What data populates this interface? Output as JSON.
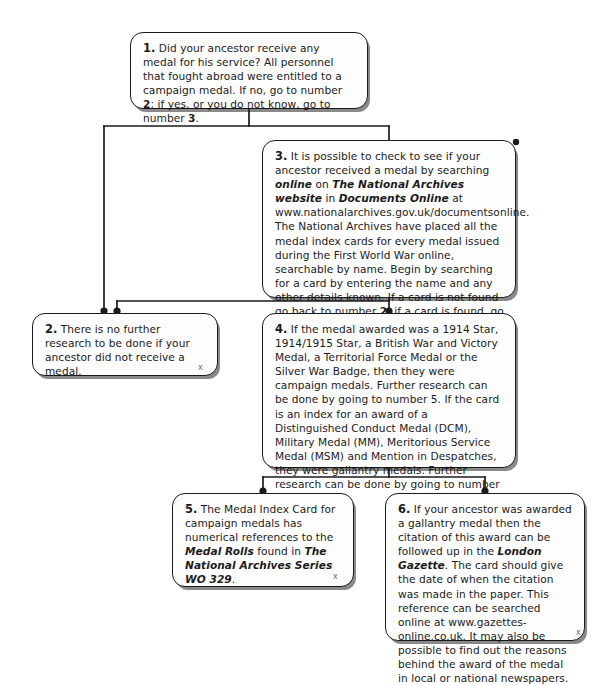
{
  "diagram": {
    "style": {
      "line_color": "#1a1a1a",
      "box_fill": "#fdfdfd",
      "text_color": "#1b1b1b"
    },
    "nodes": [
      {
        "id": "1",
        "number": "1.",
        "text": "Did your ancestor receive any medal for his service? All personnel that fought abroad were entitled to a campaign medal. If no, go to number 2; if yes, or you do not know, go to number 3."
      },
      {
        "id": "3",
        "number": "3.",
        "text": "It is possible to check to see if your ancestor received a medal by searching online on The National Archives website in Documents Online at www.nationalarchives.gov.uk/documentsonline. The National Archives have placed all the medal index cards for every medal issued during the First World War online, searchable by name. Begin by searching for a card by entering the name and any other details known. If a card is not found go back to number 2; if a card is found, go to number 4."
      },
      {
        "id": "2",
        "number": "2.",
        "text": "There is no further research to be done if your ancestor did not receive a medal."
      },
      {
        "id": "4",
        "number": "4.",
        "text": "If the medal awarded was a 1914 Star, 1914/1915 Star, a British War and Victory Medal, a Territorial Force Medal or the Silver War Badge, then they were campaign medals. Further research can be done by going to number 5. If the card is an index for an award of a Distinguished Conduct Medal (DCM), Military Medal (MM), Meritorious Service Medal (MSM) and Mention in Despatches, they were gallantry medals. Further research can be done by going to number 6."
      },
      {
        "id": "5",
        "number": "5.",
        "text": "The Medal Index Card for campaign medals has numerical references to the Medal Rolls found in The National Archives Series WO 329."
      },
      {
        "id": "6",
        "number": "6.",
        "text": "If your ancestor was awarded a gallantry medal then the citation of this award can be followed up in the London Gazette. The card should give the date of when the citation was made in the paper. This reference can be searched online at www.gazettes-online.co.uk. It may also be possible to find out the reasons behind the award of the medal in local or national newspapers."
      }
    ],
    "marks": {
      "x_artifact": "x"
    }
  }
}
